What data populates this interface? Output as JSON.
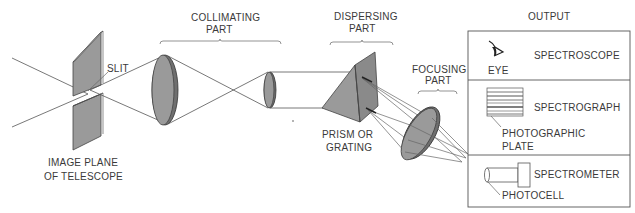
{
  "diagram": {
    "labels": {
      "slit": "SLIT",
      "image_plane_line1": "IMAGE PLANE",
      "image_plane_line2": "OF TELESCOPE",
      "collimating_line1": "COLLIMATING",
      "collimating_line2": "PART",
      "dispersing_line1": "DISPERSING",
      "dispersing_line2": "PART",
      "prism_line1": "PRISM OR",
      "prism_line2": "GRATING",
      "focusing_line1": "FOCUSING",
      "focusing_line2": "PART",
      "output": "OUTPUT"
    },
    "output_box": {
      "rows": [
        {
          "instrument": "SPECTROSCOPE",
          "detector": "EYE",
          "icon": "eye-icon"
        },
        {
          "instrument": "SPECTROGRAPH",
          "detector_line1": "PHOTOGRAPHIC",
          "detector_line2": "PLATE",
          "icon": "photographic-plate-icon"
        },
        {
          "instrument": "SPECTROMETER",
          "detector": "PHOTOCELL",
          "icon": "photocell-icon"
        }
      ]
    },
    "colors": {
      "component_fill": "#9a9a9a",
      "line": "#555555",
      "text": "#3a3a3a"
    }
  }
}
